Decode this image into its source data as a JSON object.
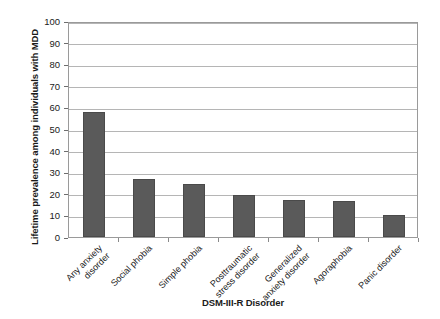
{
  "chart_data": {
    "type": "bar",
    "title": "",
    "xlabel": "DSM-III-R Disorder",
    "ylabel": "Lifetime prevalence among individuals with MDD",
    "categories": [
      "Any anxiety\ndisorder",
      "Social phobia",
      "Simple phobia",
      "Posttraumatic\nstress disorder",
      "Generalized\nanxiety disorder",
      "Agoraphobia",
      "Panic disorder"
    ],
    "values": [
      58,
      27,
      24.5,
      19.5,
      17,
      16.5,
      10
    ],
    "ylim": [
      0,
      100
    ],
    "yticks": [
      0,
      10,
      20,
      30,
      40,
      50,
      60,
      70,
      80,
      90,
      100
    ],
    "ytick_labels": [
      "0",
      "10",
      "20",
      "30",
      "40",
      "50",
      "60",
      "70",
      "80",
      "90",
      "100"
    ],
    "grid": true,
    "legend": false,
    "bar_color": "#5a5a5a",
    "grid_color": "#b5b5b5",
    "axis_color": "#9a9a9a",
    "background": "#ffffff"
  }
}
